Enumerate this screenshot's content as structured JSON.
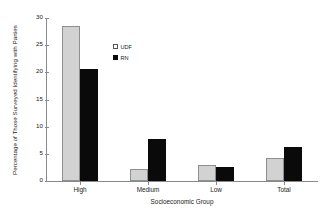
{
  "chart_data": {
    "type": "bar",
    "title": "",
    "subtitle": "",
    "xlabel": "Socioeconomic Group",
    "ylabel": "Percentage of Those Surveyed Identifying with Parties",
    "categories": [
      "High",
      "Medium",
      "Low",
      "Total"
    ],
    "series": [
      {
        "name": "UDF",
        "color": "#d2d2d2",
        "values": [
          28.5,
          2.2,
          2.9,
          4.2
        ]
      },
      {
        "name": "RN",
        "color": "#0a0a0a",
        "values": [
          20.7,
          7.7,
          2.5,
          6.3
        ]
      }
    ],
    "ylim": [
      0,
      30
    ],
    "yticks": [
      0,
      5,
      10,
      15,
      20,
      25,
      30
    ],
    "ytick_labels": [
      "0",
      "5",
      "10",
      "15",
      "20",
      "25",
      "30"
    ],
    "grid": false,
    "legend_position": "upper-center-inside",
    "axis_color": "#8a8a8a",
    "text_color": "#1a1a1a",
    "background": "#ffffff"
  }
}
